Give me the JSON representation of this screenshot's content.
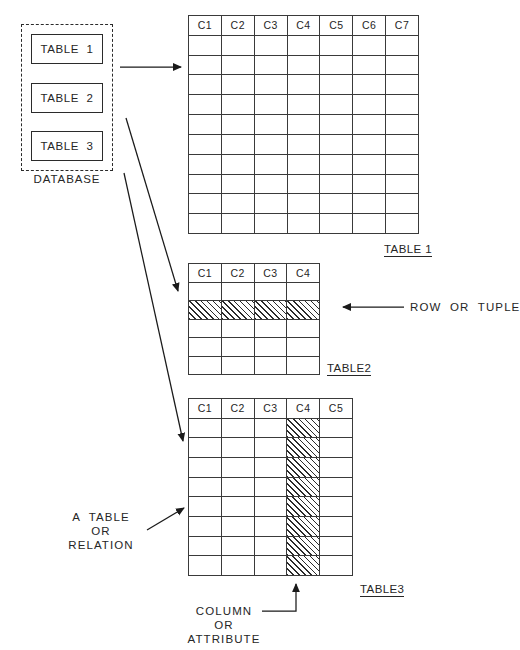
{
  "diagram": {
    "ink_color": "#2b2b2b",
    "grid_color": "#3a3a3a",
    "background": "#ffffff",
    "hatch_color": "#2b2b2b"
  },
  "database": {
    "caption": "DATABASE",
    "tables": [
      {
        "label": "TABLE  1"
      },
      {
        "label": "TABLE  2"
      },
      {
        "label": "TABLE  3"
      }
    ]
  },
  "tables": [
    {
      "id": "table1",
      "label": "TABLE 1",
      "columns": [
        "C1",
        "C2",
        "C3",
        "C4",
        "C5",
        "C6",
        "C7"
      ],
      "body_rows": 10,
      "highlight": {
        "kind": "none"
      }
    },
    {
      "id": "table2",
      "label": "TABLE2",
      "columns": [
        "C1",
        "C2",
        "C3",
        "C4"
      ],
      "body_rows": 5,
      "highlight": {
        "kind": "row",
        "index": 2
      }
    },
    {
      "id": "table3",
      "label": "TABLE3",
      "columns": [
        "C1",
        "C2",
        "C3",
        "C4",
        "C5"
      ],
      "body_rows": 8,
      "highlight": {
        "kind": "column",
        "index": 4
      }
    }
  ],
  "annotations": {
    "row_or_tuple": "ROW  OR  TUPLE",
    "a_table_or_relation": "A  TABLE\nOR\nRELATION",
    "column_or_attribute": "COLUMN\nOR\nATTRIBUTE"
  },
  "connectors": [
    {
      "name": "database-to-table1",
      "from": [
        120,
        67
      ],
      "to": [
        184,
        67
      ]
    },
    {
      "name": "database-to-table2",
      "from": [
        126,
        118
      ],
      "to": [
        181,
        294
      ]
    },
    {
      "name": "database-to-table3",
      "from": [
        124,
        173
      ],
      "to": [
        186,
        444
      ]
    },
    {
      "name": "row-callout",
      "from": [
        404,
        307
      ],
      "to": [
        340,
        307
      ]
    },
    {
      "name": "table-callout",
      "from": [
        148,
        529
      ],
      "to": [
        187,
        506
      ]
    },
    {
      "name": "column-callout",
      "from": [
        262,
        612
      ],
      "to": [
        296,
        581
      ]
    }
  ]
}
